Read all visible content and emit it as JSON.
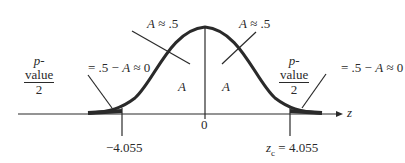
{
  "diagram": {
    "type": "normal-distribution-two-tailed-test",
    "axis_variable": "z",
    "center_label": "0",
    "left_critical_label": "−4.055",
    "right_critical_prefix": "z",
    "right_critical_subscript": "c",
    "right_critical_value": " = 4.055",
    "inner_area_label": "A",
    "top_left_annotation": {
      "var": "A",
      "rest": " ≈ .5"
    },
    "top_right_annotation": {
      "var": "A",
      "rest": " ≈ .5"
    },
    "left_tail_annotation": {
      "numerator_italic": "p",
      "numerator_rest": "-value",
      "denominator": "2",
      "rhs_prefix": " = .5 − ",
      "rhs_var": "A",
      "rhs_suffix": " ≈ 0"
    },
    "right_tail_annotation": {
      "numerator_italic": "p",
      "numerator_rest": "-value",
      "denominator": "2",
      "rhs_prefix": " = .5 − ",
      "rhs_var": "A",
      "rhs_suffix": " ≈ 0"
    },
    "colors": {
      "curve": "#2a2a2a",
      "text": "#2a2a2a",
      "background": "#ffffff"
    }
  }
}
